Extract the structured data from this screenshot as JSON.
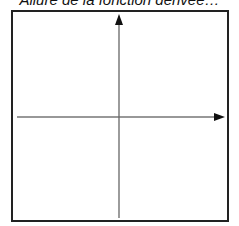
{
  "title": "Allure de la fonction dérivée…",
  "colors": {
    "frame": "#222222",
    "axis_x": "#333333",
    "axis_y": "#555555"
  },
  "diagram": {
    "frame": {
      "x": 12,
      "y": 11,
      "width": 216,
      "height": 210
    },
    "x_axis": {
      "x1": 17,
      "x2": 224,
      "y": 117,
      "arrow": "right"
    },
    "y_axis": {
      "x": 119,
      "y1": 218,
      "y2": 14,
      "arrow": "up"
    }
  }
}
